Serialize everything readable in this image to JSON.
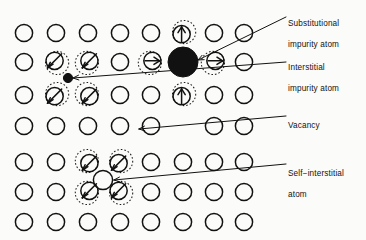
{
  "figure": {
    "background_color": "#fbfbf9",
    "ink_color": "#121212"
  },
  "labels": {
    "substitutional": {
      "line1": "Substitutional",
      "line2": "impurity atom"
    },
    "interstitial": {
      "line1": "Interstitial",
      "line2": "impurity atom"
    },
    "vacancy": {
      "line1": "Vacancy",
      "line2": ""
    },
    "self_interstitial": {
      "line1": "Self−interstitial",
      "line2": "atom"
    }
  },
  "lattice": {
    "rows": 7,
    "columns": 8,
    "col_x": [
      24,
      56,
      88,
      120,
      151,
      183,
      214,
      244
    ],
    "row_y": [
      33,
      62,
      95,
      126,
      162,
      192,
      222
    ],
    "atom_radius": 8.6,
    "halo_radius": 11.6,
    "stroke_width": 1.5,
    "cells": [
      [
        {
          "type": "atom"
        },
        {
          "type": "atom"
        },
        {
          "type": "atom"
        },
        {
          "type": "atom"
        },
        {
          "type": "atom"
        },
        {
          "type": "atom-arrow-up"
        },
        {
          "type": "atom"
        },
        {
          "type": "atom"
        }
      ],
      [
        {
          "type": "atom"
        },
        {
          "type": "atom-slash"
        },
        {
          "type": "atom-slash"
        },
        {
          "type": "atom"
        },
        {
          "type": "atom-arrow-right"
        },
        {
          "type": "atom-filled-large"
        },
        {
          "type": "atom-arrow-right"
        },
        {
          "type": "atom"
        }
      ],
      [
        {
          "type": "atom"
        },
        {
          "type": "atom-slash"
        },
        {
          "type": "atom-slash"
        },
        {
          "type": "atom"
        },
        {
          "type": "atom"
        },
        {
          "type": "atom-arrow-up"
        },
        {
          "type": "atom"
        },
        {
          "type": "atom"
        }
      ],
      [
        {
          "type": "atom"
        },
        {
          "type": "atom"
        },
        {
          "type": "atom"
        },
        {
          "type": "atom"
        },
        {
          "type": "atom"
        },
        {
          "type": "vacancy"
        },
        {
          "type": "atom"
        },
        {
          "type": "atom"
        }
      ],
      [
        {
          "type": "atom"
        },
        {
          "type": "atom"
        },
        {
          "type": "atom-slash"
        },
        {
          "type": "atom-slash"
        },
        {
          "type": "atom"
        },
        {
          "type": "atom"
        },
        {
          "type": "atom"
        },
        {
          "type": "atom"
        }
      ],
      [
        {
          "type": "atom"
        },
        {
          "type": "atom"
        },
        {
          "type": "atom-slash"
        },
        {
          "type": "atom-slash"
        },
        {
          "type": "atom"
        },
        {
          "type": "atom"
        },
        {
          "type": "atom"
        },
        {
          "type": "atom"
        }
      ],
      [
        {
          "type": "atom"
        },
        {
          "type": "atom"
        },
        {
          "type": "atom"
        },
        {
          "type": "atom"
        },
        {
          "type": "atom"
        },
        {
          "type": "atom"
        },
        {
          "type": "atom"
        },
        {
          "type": "atom"
        }
      ]
    ]
  },
  "defects": {
    "substitutional_atom": {
      "x": 183,
      "y": 62,
      "radius": 15.0,
      "fill": "#111111"
    },
    "interstitial_atom": {
      "x": 68,
      "y": 78,
      "radius": 4.6,
      "fill": "#111111"
    },
    "vacancy_site": {
      "x": 183,
      "y": 126
    },
    "self_interstitial_atom": {
      "x": 103,
      "y": 180,
      "radius": 9.6
    }
  },
  "leader_lines": [
    {
      "name": "substitutional",
      "x1": 286,
      "y1": 17,
      "x2": 198,
      "y2": 60
    },
    {
      "name": "interstitial",
      "x1": 286,
      "y1": 62,
      "x2": 73,
      "y2": 78
    },
    {
      "name": "vacancy",
      "x1": 286,
      "y1": 116,
      "x2": 139,
      "y2": 129
    },
    {
      "name": "self_interstitial",
      "x1": 286,
      "y1": 164,
      "x2": 114,
      "y2": 180
    }
  ]
}
